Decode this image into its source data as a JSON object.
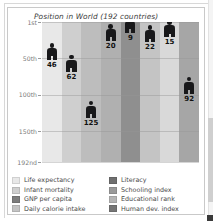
{
  "figure": {
    "title": "Position in World (192 countries)",
    "frame_color": "#c9c9c9"
  },
  "scrollbar": {
    "name": "vertical-scrollbar"
  },
  "chart_data": {
    "type": "bar",
    "title": "Position in World (192 countries)",
    "xlabel": "",
    "ylabel": "",
    "grid": true,
    "legend_position": "bottom",
    "axis_inverted": true,
    "ylim": [
      1,
      192
    ],
    "ytick_labels": [
      "1st",
      "50th",
      "100th",
      "150th",
      "192nd"
    ],
    "ytick_values": [
      1,
      50,
      100,
      150,
      192
    ],
    "categories": [
      "Life expectancy",
      "Infant mortality",
      "GNP per capita",
      "Daily calorie intake",
      "Literacy",
      "Schooling index",
      "Educational rank",
      "Human dev. index"
    ],
    "values": [
      46,
      62,
      125,
      20,
      9,
      22,
      15,
      92
    ],
    "value_labels": [
      "46",
      "62",
      "125",
      "20",
      "9",
      "22",
      "15",
      "92"
    ],
    "band_colors": [
      "#e8e8e8",
      "#cfcfcf",
      "#bdbdbd",
      "#b0b0b0",
      "#8f8f8f",
      "#c4c4c4",
      "#d9d9d9",
      "#a6a6a6"
    ]
  },
  "legend": {
    "left": [
      {
        "label": "Life expectancy",
        "color": "#e8e8e8"
      },
      {
        "label": "Infant mortality",
        "color": "#cfcfcf"
      },
      {
        "label": "GNP per capita",
        "color": "#7d7d7d"
      },
      {
        "label": "Daily calorie intake",
        "color": "#c4c4c4"
      }
    ],
    "right": [
      {
        "label": "Literacy",
        "color": "#6f6f6f"
      },
      {
        "label": "Schooling index",
        "color": "#9a9a9a"
      },
      {
        "label": "Educational rank",
        "color": "#b5b5b5"
      },
      {
        "label": "Human dev. index",
        "color": "#767676"
      }
    ]
  }
}
